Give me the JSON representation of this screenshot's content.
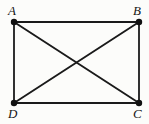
{
  "figure": {
    "name": "rectangle-with-diagonals",
    "background_color": "#fcfcfa",
    "stroke_color": "#1a1a1a",
    "vertex_color": "#111111",
    "edge_stroke_width": 1.8,
    "diagonal_stroke_width": 1.9,
    "vertex_radius": 3.2,
    "vertices": [
      {
        "id": "A",
        "label": "A",
        "x": 14,
        "y": 22,
        "label_x": 8,
        "label_y": 4,
        "corner": "top-left"
      },
      {
        "id": "B",
        "label": "B",
        "x": 139,
        "y": 22,
        "label_x": 133,
        "label_y": 4,
        "corner": "top-right"
      },
      {
        "id": "C",
        "label": "C",
        "x": 139,
        "y": 103,
        "label_x": 133,
        "label_y": 107,
        "corner": "bottom-right"
      },
      {
        "id": "D",
        "label": "D",
        "x": 14,
        "y": 103,
        "label_x": 8,
        "label_y": 107,
        "corner": "bottom-left"
      }
    ],
    "edges": [
      {
        "id": "AB",
        "from": "A",
        "to": "B",
        "kind": "side"
      },
      {
        "id": "BC",
        "from": "B",
        "to": "C",
        "kind": "side"
      },
      {
        "id": "CD",
        "from": "C",
        "to": "D",
        "kind": "side"
      },
      {
        "id": "DA",
        "from": "D",
        "to": "A",
        "kind": "side"
      },
      {
        "id": "AC",
        "from": "A",
        "to": "C",
        "kind": "diagonal"
      },
      {
        "id": "BD",
        "from": "B",
        "to": "D",
        "kind": "diagonal"
      }
    ],
    "intersection": {
      "id": "center",
      "x": 76.5,
      "y": 62.5
    }
  }
}
